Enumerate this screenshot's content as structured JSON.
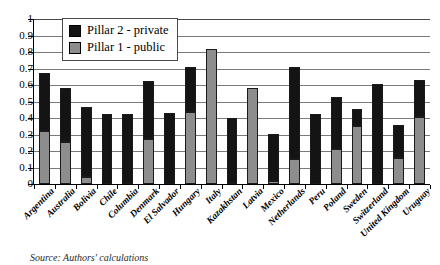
{
  "chart_data": {
    "type": "bar",
    "subtype": "stacked-vertical",
    "title": "",
    "xlabel": "",
    "ylabel": "",
    "ylim": [
      0,
      1
    ],
    "ytick_step": 0.1,
    "yticks": [
      "1",
      "0.9",
      "0.8",
      "0.7",
      "0.6",
      "0.5",
      "0.4",
      "0.3",
      "0.2",
      "0.1",
      "0"
    ],
    "grid": true,
    "legend_position": "top-left-inside",
    "categories": [
      "Argentina",
      "Australia",
      "Bolivia",
      "Chile",
      "Columbia",
      "Denmark",
      "El Salvador",
      "Hungary",
      "Italy",
      "Kazakhstan",
      "Latvia",
      "Mexico",
      "Netherlands",
      "Peru",
      "Poland",
      "Sweden",
      "Switzerland",
      "United Kingdom",
      "Uruguay"
    ],
    "series": [
      {
        "name": "Pillar 1 - public",
        "color": "#8d8d8d",
        "values": [
          0.32,
          0.255,
          0.04,
          0.0,
          0.0,
          0.275,
          0.0,
          0.435,
          0.82,
          0.0,
          0.58,
          0.02,
          0.15,
          0.0,
          0.21,
          0.35,
          0.0,
          0.155,
          0.405
        ]
      },
      {
        "name": "Pillar 2 - private",
        "color": "#141414",
        "values": [
          0.355,
          0.325,
          0.425,
          0.425,
          0.425,
          0.35,
          0.43,
          0.275,
          0.0,
          0.4,
          0.0,
          0.285,
          0.56,
          0.425,
          0.315,
          0.105,
          0.605,
          0.2,
          0.225
        ]
      }
    ],
    "totals": [
      0.675,
      0.58,
      0.465,
      0.425,
      0.425,
      0.625,
      0.43,
      0.71,
      0.82,
      0.4,
      0.58,
      0.305,
      0.71,
      0.425,
      0.525,
      0.455,
      0.605,
      0.355,
      0.63
    ]
  },
  "legend": {
    "entries": [
      {
        "label": "Pillar 2 - private",
        "swatch": "private"
      },
      {
        "label": "Pillar 1 - public",
        "swatch": "public"
      }
    ]
  },
  "source": {
    "text": "Source: Authors' calculations"
  }
}
